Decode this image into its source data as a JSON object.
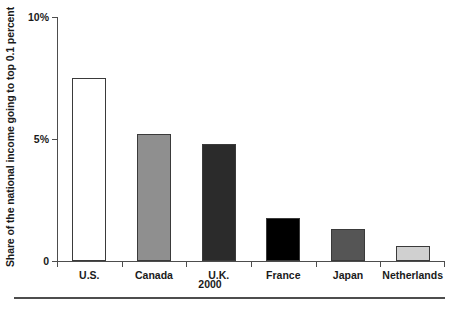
{
  "chart_data": {
    "type": "bar",
    "title": "",
    "xlabel": "2000",
    "ylabel": "Share of the national income going to top 0.1 percent",
    "categories": [
      "U.S.",
      "Canada",
      "U.K.",
      "France",
      "Japan",
      "Netherlands"
    ],
    "values": [
      7.5,
      5.2,
      4.8,
      1.75,
      1.3,
      0.6
    ],
    "series": [
      {
        "name": "Share of national income going to top 0.1 percent",
        "values": [
          7.5,
          5.2,
          4.8,
          1.75,
          1.3,
          0.6
        ]
      }
    ],
    "bar_colors": [
      "#ffffff",
      "#8f8f8f",
      "#2b2b2b",
      "#000000",
      "#555555",
      "#d0d0d0"
    ],
    "bar_border_color": "#3a3a3a",
    "ylim": [
      0,
      10
    ],
    "ytick_values": [
      0,
      5,
      10
    ],
    "ytick_labels": [
      "0",
      "5%",
      "10%"
    ],
    "grid": false,
    "legend": "none",
    "axis_color": "#4d4d4d"
  },
  "axes": {
    "y_title": "Share of the national income going to top 0.1 percent",
    "x_sub_label": "2000"
  },
  "ticks": {
    "y": [
      {
        "label": "10%",
        "value": 10
      },
      {
        "label": "5%",
        "value": 5
      },
      {
        "label": "0",
        "value": 0
      }
    ]
  },
  "bars": [
    {
      "label": "U.S.",
      "value": 7.5,
      "color": "#ffffff"
    },
    {
      "label": "Canada",
      "value": 5.2,
      "color": "#8f8f8f"
    },
    {
      "label": "U.K.",
      "value": 4.8,
      "color": "#2b2b2b"
    },
    {
      "label": "France",
      "value": 1.75,
      "color": "#000000"
    },
    {
      "label": "Japan",
      "value": 1.3,
      "color": "#555555"
    },
    {
      "label": "Netherlands",
      "value": 0.6,
      "color": "#d0d0d0"
    }
  ]
}
